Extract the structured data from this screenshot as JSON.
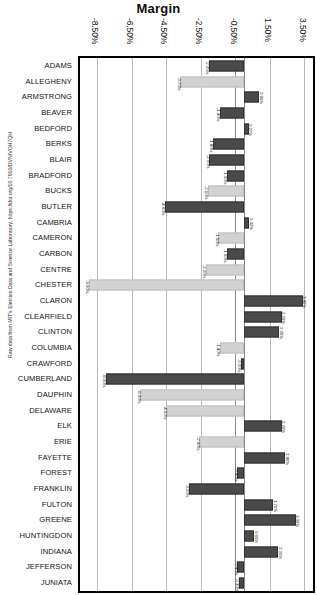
{
  "title": "Margin",
  "source_note": "Raw data from MIT's Election Data and Science Laboratory, https://doi.org/10.7910/DVN/VOH7QH",
  "axis": {
    "ticks": [
      "-8.50%",
      "-6.50%",
      "-4.50%",
      "-2.50%",
      "-0.50%",
      "1.50%",
      "3.50%"
    ],
    "tick_values": [
      -8.5,
      -6.5,
      -4.5,
      -2.5,
      -0.5,
      1.5,
      3.5
    ],
    "min": -9.5,
    "max": 4.0
  },
  "colors": {
    "bar_dark": "#4a4a4a",
    "bar_light": "#d2d2d2",
    "grid": "#b9b9b9",
    "frame": "#000000",
    "text": "#111111"
  },
  "chart_data": {
    "type": "bar",
    "orientation": "horizontal",
    "title": "Margin",
    "xlabel": "Margin",
    "ylabel": "",
    "xlim": [
      -9.5,
      4.0
    ],
    "grid": true,
    "legend": "none",
    "categories": [
      "ADAMS",
      "ALLEGHENY",
      "ARMSTRONG",
      "BEAVER",
      "BEDFORD",
      "BERKS",
      "BLAIR",
      "BRADFORD",
      "BUCKS",
      "BUTLER",
      "CAMBRIA",
      "CAMERON",
      "CARBON",
      "CENTRE",
      "CHESTER",
      "CLARON",
      "CLEARFIELD",
      "CLINTON",
      "COLUMBIA",
      "CRAWFORD",
      "CUMBERLAND",
      "DAUPHIN",
      "DELAWARE",
      "ELK",
      "ERIE",
      "FAYETTE",
      "FOREST",
      "FRANKLIN",
      "FULTON",
      "GREENE",
      "HUNTINGDON",
      "INDIANA",
      "JEFFERSON",
      "JUNIATA"
    ],
    "values": [
      -2.05,
      -3.7,
      0.9,
      -1.4,
      0.27,
      -1.8,
      -2.0,
      -1.0,
      -2.1,
      -4.6,
      0.32,
      -1.5,
      -1.0,
      -2.2,
      -9.0,
      3.4,
      2.2,
      2.05,
      -1.4,
      -0.2,
      -8.0,
      -6.0,
      -4.5,
      2.2,
      -2.6,
      2.4,
      -0.4,
      -3.2,
      1.7,
      3.0,
      0.6,
      2.0,
      -0.4,
      -0.3
    ],
    "value_labels": [
      "-2.05%",
      "-3.70%",
      "0.90%",
      "-1.40%",
      "0.27%",
      "-1.80%",
      "-2.00%",
      "-1.00%",
      "-2.10%",
      "-4.60%",
      "0.32%",
      "-1.50%",
      "-1.00%",
      "-2.20%",
      "-9.00%",
      "3.40%",
      "2.20%",
      "2.05%",
      "-1.40%",
      "-0.20%",
      "-8.00%",
      "-6.00%",
      "-4.50%",
      "2.20%",
      "-2.60%",
      "2.40%",
      "-0.40%",
      "-3.20%",
      "1.70%",
      "3.00%",
      "0.60%",
      "2.00%",
      "-0.40%",
      "-0.30%"
    ],
    "styles": [
      "dark",
      "light",
      "dark",
      "dark",
      "dark",
      "dark",
      "dark",
      "dark",
      "light",
      "dark",
      "dark",
      "light",
      "dark",
      "light",
      "light",
      "dark",
      "dark",
      "dark",
      "light",
      "dark",
      "dark",
      "light",
      "light",
      "dark",
      "light",
      "dark",
      "dark",
      "dark",
      "dark",
      "dark",
      "dark",
      "dark",
      "dark",
      "dark"
    ]
  }
}
